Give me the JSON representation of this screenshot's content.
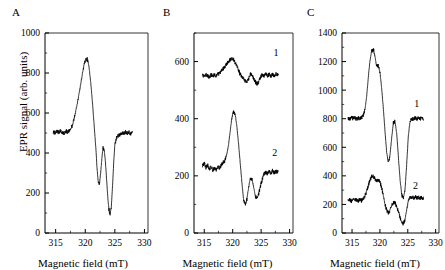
{
  "figure": {
    "axis_label_y": "EPR signal (arb. units)",
    "axis_label_x": "Magnetic field (mT)",
    "stroke_color": "#000000"
  },
  "panels": [
    {
      "letter": "A",
      "curve_labels": []
    },
    {
      "letter": "B",
      "curve_labels": [
        "1",
        "2"
      ]
    },
    {
      "letter": "C",
      "curve_labels": [
        "1",
        "2"
      ]
    }
  ],
  "chart_data": [
    {
      "type": "line",
      "panel": "A",
      "title": "A",
      "xlabel": "Magnetic field (mT)",
      "ylabel": "EPR signal (arb. units)",
      "xlim": [
        313.2,
        330.6
      ],
      "ylim": [
        0,
        1000
      ],
      "xticks": [
        315,
        320,
        325,
        330
      ],
      "yticks": [
        0,
        200,
        400,
        600,
        800,
        1000
      ],
      "xminor": [
        317.5,
        322.5,
        327.5
      ],
      "yminor": [
        100,
        300,
        500,
        700,
        900
      ],
      "grid": false,
      "legend": "none",
      "series": [
        {
          "name": "A",
          "label": "",
          "x": [
            314.6,
            314.9,
            315.2,
            315.5,
            315.8,
            316.1,
            316.4,
            316.7,
            317.0,
            317.3,
            317.6,
            317.9,
            318.2,
            318.5,
            318.8,
            319.1,
            319.4,
            319.7,
            320.0,
            320.3,
            320.6,
            320.9,
            321.2,
            321.5,
            321.8,
            322.0,
            322.2,
            322.4,
            322.6,
            322.8,
            323.0,
            323.2,
            323.4,
            323.6,
            323.8,
            324.0,
            324.2,
            324.4,
            324.6,
            324.8,
            325.0,
            325.3,
            325.6,
            325.9,
            326.2,
            326.5,
            326.8,
            327.1,
            327.4,
            327.7,
            328.0
          ],
          "y": [
            505,
            500,
            508,
            503,
            512,
            505,
            500,
            510,
            505,
            512,
            520,
            545,
            580,
            625,
            670,
            720,
            775,
            825,
            862,
            872,
            840,
            760,
            660,
            540,
            420,
            320,
            250,
            245,
            300,
            370,
            425,
            415,
            360,
            270,
            180,
            120,
            95,
            130,
            230,
            350,
            440,
            478,
            488,
            492,
            500,
            496,
            505,
            498,
            503,
            496,
            500
          ]
        }
      ]
    },
    {
      "type": "line",
      "panel": "B",
      "title": "B",
      "xlabel": "Magnetic field (mT)",
      "ylabel": "EPR signal (arb. units)",
      "xlim": [
        313.2,
        330.6
      ],
      "ylim": [
        0,
        700
      ],
      "xticks": [
        315,
        320,
        325,
        330
      ],
      "yticks": [
        0,
        200,
        400,
        600
      ],
      "xminor": [
        317.5,
        322.5,
        327.5
      ],
      "yminor": [
        100,
        300,
        500,
        700
      ],
      "grid": false,
      "legend": "inline-curve-labels",
      "series": [
        {
          "name": "curve 1",
          "label": "1",
          "label_x": 327.6,
          "label_y": 620,
          "x": [
            314.7,
            315.0,
            315.3,
            315.6,
            315.9,
            316.2,
            316.5,
            316.8,
            317.1,
            317.4,
            317.7,
            318.0,
            318.3,
            318.6,
            318.9,
            319.2,
            319.5,
            319.8,
            320.1,
            320.4,
            320.7,
            321.0,
            321.3,
            321.6,
            321.9,
            322.2,
            322.5,
            322.8,
            323.1,
            323.4,
            323.7,
            324.0,
            324.3,
            324.6,
            324.9,
            325.2,
            325.5,
            325.8,
            326.1,
            326.4,
            326.7,
            327.0,
            327.3,
            327.6,
            328.0
          ],
          "y": [
            552,
            548,
            556,
            550,
            545,
            553,
            548,
            556,
            550,
            556,
            560,
            568,
            574,
            580,
            590,
            598,
            605,
            612,
            608,
            598,
            585,
            570,
            556,
            548,
            540,
            532,
            528,
            540,
            556,
            552,
            540,
            528,
            522,
            530,
            545,
            556,
            550,
            556,
            548,
            556,
            550,
            556,
            548,
            556,
            552
          ]
        },
        {
          "name": "curve 2",
          "label": "2",
          "label_x": 327.4,
          "label_y": 268,
          "x": [
            314.7,
            315.0,
            315.3,
            315.6,
            315.9,
            316.2,
            316.5,
            316.8,
            317.1,
            317.4,
            317.7,
            318.0,
            318.3,
            318.6,
            318.9,
            319.2,
            319.5,
            319.8,
            320.1,
            320.4,
            320.7,
            321.0,
            321.3,
            321.6,
            321.9,
            322.2,
            322.5,
            322.8,
            323.1,
            323.4,
            323.7,
            324.0,
            324.3,
            324.6,
            324.9,
            325.2,
            325.5,
            325.8,
            326.1,
            326.4,
            326.7,
            327.0,
            327.3,
            327.6,
            328.0
          ],
          "y": [
            235,
            245,
            228,
            238,
            222,
            232,
            220,
            228,
            222,
            234,
            226,
            238,
            248,
            252,
            268,
            300,
            345,
            395,
            425,
            418,
            380,
            320,
            250,
            180,
            120,
            100,
            118,
            160,
            192,
            188,
            158,
            128,
            120,
            140,
            165,
            188,
            205,
            212,
            206,
            216,
            208,
            218,
            210,
            216,
            212
          ]
        }
      ]
    },
    {
      "type": "line",
      "panel": "C",
      "title": "C",
      "xlabel": "Magnetic field (mT)",
      "ylabel": "EPR signal (arb. units)",
      "xlim": [
        313.2,
        330.6
      ],
      "ylim": [
        0,
        1400
      ],
      "xticks": [
        315,
        320,
        325,
        330
      ],
      "yticks": [
        0,
        200,
        400,
        600,
        800,
        1000,
        1200,
        1400
      ],
      "xminor": [
        317.5,
        322.5,
        327.5
      ],
      "yminor": [
        100,
        300,
        500,
        700,
        900,
        1100,
        1300
      ],
      "grid": false,
      "legend": "inline-curve-labels",
      "series": [
        {
          "name": "curve 1",
          "label": "1",
          "label_x": 326.6,
          "label_y": 880,
          "x": [
            314.3,
            314.6,
            314.9,
            315.2,
            315.5,
            315.8,
            316.1,
            316.4,
            316.7,
            317.0,
            317.3,
            317.6,
            317.9,
            318.2,
            318.5,
            318.8,
            319.1,
            319.4,
            319.7,
            320.0,
            320.3,
            320.6,
            320.9,
            321.2,
            321.5,
            321.8,
            322.1,
            322.4,
            322.7,
            323.0,
            323.3,
            323.6,
            323.9,
            324.2,
            324.5,
            324.8,
            325.1,
            325.4,
            325.7,
            326.0,
            326.3,
            326.6,
            326.9,
            327.2,
            327.5,
            327.8
          ],
          "y": [
            805,
            798,
            808,
            800,
            806,
            798,
            805,
            800,
            810,
            820,
            860,
            950,
            1080,
            1200,
            1270,
            1290,
            1240,
            1165,
            1170,
            1130,
            1020,
            880,
            720,
            570,
            490,
            540,
            660,
            770,
            780,
            700,
            540,
            380,
            270,
            240,
            300,
            480,
            680,
            780,
            800,
            795,
            805,
            798,
            808,
            800,
            806,
            800
          ]
        },
        {
          "name": "curve 2",
          "label": "2",
          "label_x": 326.4,
          "label_y": 305,
          "x": [
            314.3,
            314.6,
            314.9,
            315.2,
            315.5,
            315.8,
            316.1,
            316.4,
            316.7,
            317.0,
            317.3,
            317.6,
            317.9,
            318.2,
            318.5,
            318.8,
            319.1,
            319.4,
            319.7,
            320.0,
            320.3,
            320.6,
            320.9,
            321.2,
            321.5,
            321.8,
            322.1,
            322.4,
            322.7,
            323.0,
            323.3,
            323.6,
            323.9,
            324.2,
            324.5,
            324.8,
            325.1,
            325.4,
            325.7,
            326.0,
            326.3,
            326.6,
            326.9,
            327.2,
            327.5,
            327.8
          ],
          "y": [
            228,
            236,
            222,
            232,
            226,
            236,
            224,
            234,
            226,
            240,
            258,
            290,
            330,
            370,
            395,
            400,
            382,
            365,
            372,
            356,
            320,
            265,
            205,
            160,
            140,
            158,
            192,
            215,
            212,
            185,
            150,
            110,
            78,
            65,
            95,
            160,
            225,
            248,
            252,
            246,
            252,
            244,
            250,
            242,
            248,
            240
          ]
        }
      ]
    }
  ]
}
